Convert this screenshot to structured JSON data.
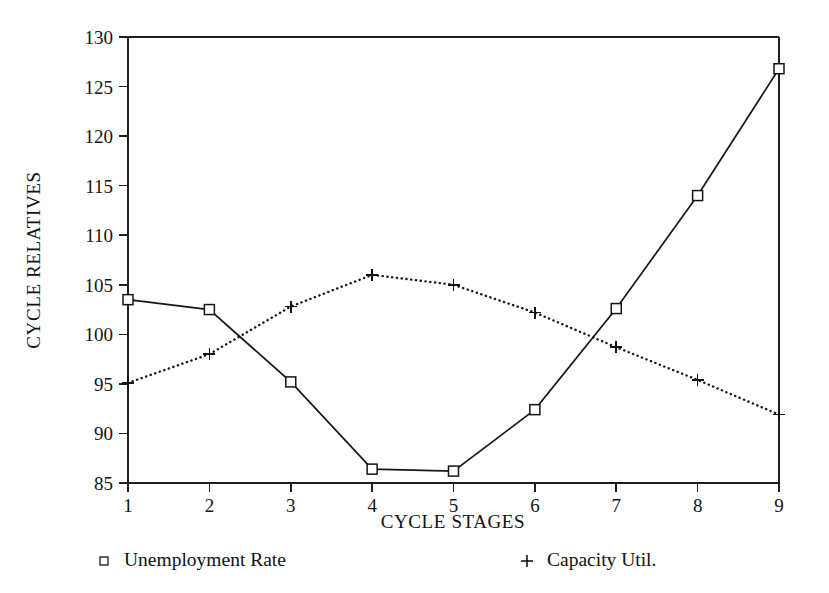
{
  "chart_data": {
    "type": "line",
    "title": "",
    "xlabel": "CYCLE STAGES",
    "ylabel": "CYCLE RELATIVES",
    "x": [
      1,
      2,
      3,
      4,
      5,
      6,
      7,
      8,
      9
    ],
    "categories": [
      "1",
      "2",
      "3",
      "4",
      "5",
      "6",
      "7",
      "8",
      "9"
    ],
    "xlim": [
      1,
      9
    ],
    "ylim": [
      85,
      130
    ],
    "xticks": [
      1,
      2,
      3,
      4,
      5,
      6,
      7,
      8,
      9
    ],
    "yticks": [
      85,
      90,
      95,
      100,
      105,
      110,
      115,
      120,
      125,
      130
    ],
    "xtick_labels": [
      "1",
      "2",
      "3",
      "4",
      "5",
      "6",
      "7",
      "8",
      "9"
    ],
    "ytick_labels": [
      "85",
      "90",
      "95",
      "100",
      "105",
      "110",
      "115",
      "120",
      "125",
      "130"
    ],
    "grid": false,
    "legend_position": "below-axes",
    "series": [
      {
        "name": "Unemployment Rate",
        "marker": "square",
        "linestyle": "solid",
        "color": "#141414",
        "values": [
          103.5,
          102.5,
          95.2,
          86.4,
          86.2,
          92.4,
          102.6,
          114.0,
          126.8
        ]
      },
      {
        "name": "Capacity Util.",
        "marker": "plus",
        "linestyle": "dotted",
        "color": "#141414",
        "values": [
          95.1,
          98.0,
          102.8,
          106.0,
          105.0,
          102.2,
          98.7,
          95.4,
          91.9
        ]
      }
    ]
  },
  "legend": {
    "entries": [
      {
        "label": "Unemployment Rate",
        "marker": "square-marker-icon"
      },
      {
        "label": "Capacity Util.",
        "marker": "plus-marker-icon"
      }
    ]
  },
  "axes": {
    "x_title": "CYCLE STAGES",
    "y_title": "CYCLE RELATIVES"
  }
}
